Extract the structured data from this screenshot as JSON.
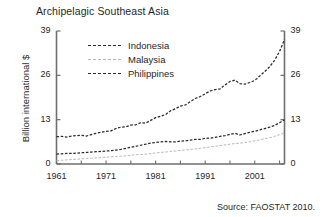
{
  "chart_data": {
    "type": "line",
    "title": "Archipelagic Southeast Asia",
    "xlabel": "",
    "ylabel": "Billion international $",
    "source": "Source: FAOSTAT 2010.",
    "xlim": [
      1961,
      2007
    ],
    "ylim": [
      0,
      39
    ],
    "yticks": [
      0,
      13,
      26,
      39
    ],
    "ytick_labels": [
      "0",
      "13",
      "26",
      "39"
    ],
    "ytick_labels_right": [
      "0",
      "13",
      "26",
      "39"
    ],
    "xticks": [
      1961,
      1971,
      1981,
      1991,
      2001
    ],
    "xtick_labels": [
      "1961",
      "1971",
      "1981",
      "1991",
      "2001"
    ],
    "xminor_step": 5,
    "grid": false,
    "legend_position": "upper-left-inside",
    "x": [
      1961,
      1962,
      1963,
      1964,
      1965,
      1966,
      1967,
      1968,
      1969,
      1970,
      1971,
      1972,
      1973,
      1974,
      1975,
      1976,
      1977,
      1978,
      1979,
      1980,
      1981,
      1982,
      1983,
      1984,
      1985,
      1986,
      1987,
      1988,
      1989,
      1990,
      1991,
      1992,
      1993,
      1994,
      1995,
      1996,
      1997,
      1998,
      1999,
      2000,
      2001,
      2002,
      2003,
      2004,
      2005,
      2006,
      2007
    ],
    "series": [
      {
        "name": "Indonesia",
        "color": "#2b2b2b",
        "style": "dashed",
        "values": [
          8.0,
          8.1,
          7.9,
          8.2,
          8.3,
          8.4,
          8.2,
          8.6,
          9.0,
          9.3,
          9.6,
          9.7,
          10.4,
          10.8,
          10.9,
          11.4,
          11.5,
          12.1,
          12.0,
          12.8,
          13.6,
          14.0,
          14.5,
          15.6,
          16.2,
          17.0,
          17.3,
          18.3,
          19.2,
          19.8,
          20.6,
          21.4,
          21.8,
          22.0,
          23.2,
          24.2,
          24.6,
          23.6,
          23.4,
          23.9,
          24.5,
          25.8,
          27.1,
          28.5,
          30.4,
          33.0,
          36.5
        ]
      },
      {
        "name": "Malaysia",
        "color": "#b8b8b8",
        "style": "dashed",
        "values": [
          1.0,
          1.1,
          1.2,
          1.3,
          1.4,
          1.5,
          1.6,
          1.7,
          1.8,
          1.9,
          2.0,
          2.1,
          2.2,
          2.3,
          2.4,
          2.6,
          2.7,
          2.8,
          2.9,
          3.1,
          3.2,
          3.4,
          3.5,
          3.7,
          3.8,
          4.0,
          4.1,
          4.3,
          4.4,
          4.6,
          4.8,
          5.0,
          5.2,
          5.4,
          5.6,
          5.8,
          6.0,
          6.1,
          6.3,
          6.5,
          6.8,
          7.1,
          7.4,
          7.7,
          8.1,
          8.6,
          9.1
        ]
      },
      {
        "name": "Philippines",
        "color": "#2b2b2b",
        "style": "dashed",
        "values": [
          2.9,
          3.0,
          3.1,
          3.1,
          3.2,
          3.3,
          3.4,
          3.5,
          3.6,
          3.7,
          3.8,
          3.9,
          4.1,
          4.3,
          4.6,
          4.9,
          5.2,
          5.5,
          5.8,
          6.1,
          6.3,
          6.5,
          6.6,
          6.5,
          6.5,
          6.7,
          6.8,
          7.0,
          7.2,
          7.2,
          7.5,
          7.6,
          7.8,
          8.1,
          8.3,
          8.7,
          9.0,
          8.5,
          8.9,
          9.3,
          9.6,
          10.0,
          10.4,
          10.8,
          11.3,
          12.1,
          13.0
        ]
      }
    ]
  },
  "legend": {
    "items": [
      {
        "label": "Indonesia"
      },
      {
        "label": "Malaysia"
      },
      {
        "label": "Philippines"
      }
    ]
  }
}
